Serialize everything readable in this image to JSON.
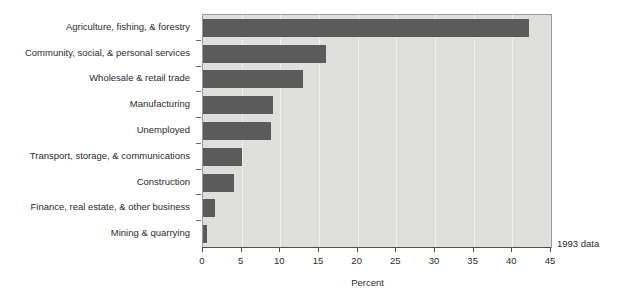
{
  "chart_data": {
    "type": "bar",
    "orientation": "horizontal",
    "title": "",
    "xlabel": "Percent",
    "ylabel": "",
    "xlim": [
      0,
      45
    ],
    "ylim": [
      0,
      9
    ],
    "grid": true,
    "legend": false,
    "xticks": [
      "0",
      "5",
      "10",
      "15",
      "20",
      "25",
      "30",
      "35",
      "40",
      "45"
    ],
    "xtick_values": [
      0,
      5,
      10,
      15,
      20,
      25,
      30,
      35,
      40,
      45
    ],
    "annotation": "1993 data",
    "bar_color": "#5b5b5b",
    "plot_background": "#dededd",
    "categories": [
      "Agriculture, fishing, & forestry",
      "Community, social, & personal services",
      "Wholesale & retail trade",
      "Manufacturing",
      "Unemployed",
      "Transport, storage, & communications",
      "Construction",
      "Finance, real estate, & other business",
      "Mining & quarrying"
    ],
    "values": [
      42.2,
      15.9,
      12.9,
      9.1,
      8.8,
      5.0,
      4.0,
      1.5,
      0.5
    ]
  }
}
